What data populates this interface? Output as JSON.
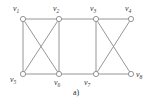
{
  "figure": {
    "caption": "a)",
    "type": "undirected-graph",
    "background_color": "#ffffff",
    "edge_color": "#8a8a8a",
    "vertex_stroke_color": "#8a8a8a",
    "vertex_fill_color": "#ffffff",
    "label_color": "#3a3a3a"
  },
  "graph": {
    "vertices": [
      {
        "id": "v1",
        "label_base": "v",
        "label_sub": "1",
        "x": 23,
        "y": 19,
        "label_x": 13,
        "label_y": 5,
        "label_position": "above-left"
      },
      {
        "id": "v2",
        "label_base": "v",
        "label_sub": "2",
        "x": 59,
        "y": 19,
        "label_x": 53,
        "label_y": 5,
        "label_position": "above-left"
      },
      {
        "id": "v3",
        "label_base": "v",
        "label_sub": "3",
        "x": 96,
        "y": 19,
        "label_x": 90,
        "label_y": 5,
        "label_position": "above-left"
      },
      {
        "id": "v4",
        "label_base": "v",
        "label_sub": "4",
        "x": 131,
        "y": 19,
        "label_x": 125,
        "label_y": 5,
        "label_position": "above-left"
      },
      {
        "id": "v5",
        "label_base": "v",
        "label_sub": "5",
        "x": 23,
        "y": 74,
        "label_x": 10,
        "label_y": 76,
        "label_position": "below-left"
      },
      {
        "id": "v6",
        "label_base": "v",
        "label_sub": "6",
        "x": 59,
        "y": 74,
        "label_x": 54,
        "label_y": 79,
        "label_position": "below"
      },
      {
        "id": "v7",
        "label_base": "v",
        "label_sub": "7",
        "x": 96,
        "y": 74,
        "label_x": 84,
        "label_y": 79,
        "label_position": "below-left"
      },
      {
        "id": "v8",
        "label_base": "v",
        "label_sub": "8",
        "x": 131,
        "y": 74,
        "label_x": 136,
        "label_y": 71,
        "label_position": "right"
      }
    ],
    "edges": [
      {
        "from": "v1",
        "to": "v2",
        "kind": "top-path"
      },
      {
        "from": "v2",
        "to": "v3",
        "kind": "top-path"
      },
      {
        "from": "v3",
        "to": "v4",
        "kind": "top-path"
      },
      {
        "from": "v5",
        "to": "v6",
        "kind": "bottom-path"
      },
      {
        "from": "v6",
        "to": "v7",
        "kind": "bottom-path"
      },
      {
        "from": "v7",
        "to": "v8",
        "kind": "bottom-path"
      },
      {
        "from": "v1",
        "to": "v5",
        "kind": "vertical"
      },
      {
        "from": "v2",
        "to": "v6",
        "kind": "vertical"
      },
      {
        "from": "v3",
        "to": "v7",
        "kind": "vertical"
      },
      {
        "from": "v1",
        "to": "v6",
        "kind": "diagonal"
      },
      {
        "from": "v2",
        "to": "v5",
        "kind": "diagonal"
      },
      {
        "from": "v3",
        "to": "v8",
        "kind": "diagonal"
      },
      {
        "from": "v4",
        "to": "v7",
        "kind": "diagonal"
      }
    ],
    "vertex_radius": 2.6,
    "edge_width": 0.9
  }
}
